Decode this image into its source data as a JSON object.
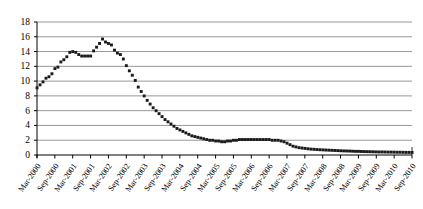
{
  "chart_data": {
    "type": "scatter",
    "title": "",
    "subtitle": "",
    "xlabel": "",
    "ylabel": "",
    "ylim": [
      0,
      18
    ],
    "ytick_step": 2,
    "yticks": [
      "0",
      "2",
      "4",
      "6",
      "8",
      "10",
      "12",
      "14",
      "16",
      "18"
    ],
    "grid": true,
    "grid_axis": "y",
    "legend": "none",
    "marker": "filled-square-dot",
    "marker_color": "#1a1a1a",
    "axis_color": "#000000",
    "grid_color": "#8c8c8c",
    "background": "#ffffff",
    "xtick_labels": [
      "Mar-2000",
      "Sep-2000",
      "Mar-2001",
      "Sep-2001",
      "Mar-2002",
      "Sep-2002",
      "Mar-2003",
      "Sep-2003",
      "Mar-2004",
      "Sep-2004",
      "Mar-2005",
      "Sep-2005",
      "Mar-2006",
      "Sep-2006",
      "Mar-2007",
      "Sep-2007",
      "Mar-2008",
      "Sep-2008",
      "Mar-2009",
      "Sep-2009",
      "Mar-2010",
      "Sep-2010"
    ],
    "xtick_interval_months": 6,
    "x_start": "Mar-2000",
    "x_end": "Sep-2010",
    "x_points": [
      "Mar-2000",
      "Apr-2000",
      "May-2000",
      "Jun-2000",
      "Jul-2000",
      "Aug-2000",
      "Sep-2000",
      "Oct-2000",
      "Nov-2000",
      "Dec-2000",
      "Jan-2001",
      "Feb-2001",
      "Mar-2001",
      "Apr-2001",
      "May-2001",
      "Jun-2001",
      "Jul-2001",
      "Aug-2001",
      "Sep-2001",
      "Oct-2001",
      "Nov-2001",
      "Dec-2001",
      "Jan-2002",
      "Feb-2002",
      "Mar-2002",
      "Apr-2002",
      "May-2002",
      "Jun-2002",
      "Jul-2002",
      "Aug-2002",
      "Sep-2002",
      "Oct-2002",
      "Nov-2002",
      "Dec-2002",
      "Jan-2003",
      "Feb-2003",
      "Mar-2003",
      "Apr-2003",
      "May-2003",
      "Jun-2003",
      "Jul-2003",
      "Aug-2003",
      "Sep-2003",
      "Oct-2003",
      "Nov-2003",
      "Dec-2003",
      "Jan-2004",
      "Feb-2004",
      "Mar-2004",
      "Apr-2004",
      "May-2004",
      "Jun-2004",
      "Jul-2004",
      "Aug-2004",
      "Sep-2004",
      "Oct-2004",
      "Nov-2004",
      "Dec-2004",
      "Jan-2005",
      "Feb-2005",
      "Mar-2005",
      "Apr-2005",
      "May-2005",
      "Jun-2005",
      "Jul-2005",
      "Aug-2005",
      "Sep-2005",
      "Oct-2005",
      "Nov-2005",
      "Dec-2005",
      "Jan-2006",
      "Feb-2006",
      "Mar-2006",
      "Apr-2006",
      "May-2006",
      "Jun-2006",
      "Jul-2006",
      "Aug-2006",
      "Sep-2006",
      "Oct-2006",
      "Nov-2006",
      "Dec-2006",
      "Jan-2007",
      "Feb-2007",
      "Mar-2007",
      "Apr-2007",
      "May-2007",
      "Jun-2007",
      "Jul-2007",
      "Aug-2007",
      "Sep-2007",
      "Oct-2007",
      "Nov-2007",
      "Dec-2007",
      "Jan-2008",
      "Feb-2008",
      "Mar-2008",
      "Apr-2008",
      "May-2008",
      "Jun-2008",
      "Jul-2008",
      "Aug-2008",
      "Sep-2008",
      "Oct-2008",
      "Nov-2008",
      "Dec-2008",
      "Jan-2009",
      "Feb-2009",
      "Mar-2009",
      "Apr-2009",
      "May-2009",
      "Jun-2009",
      "Jul-2009",
      "Aug-2009",
      "Sep-2009",
      "Oct-2009",
      "Nov-2009",
      "Dec-2009",
      "Jan-2010",
      "Feb-2010",
      "Mar-2010",
      "Apr-2010",
      "May-2010",
      "Jun-2010",
      "Jul-2010",
      "Aug-2010",
      "Sep-2010"
    ],
    "values": [
      9.1,
      9.5,
      9.9,
      10.4,
      10.6,
      11.0,
      11.7,
      11.9,
      12.6,
      12.9,
      13.3,
      13.9,
      14.0,
      13.9,
      13.6,
      13.4,
      13.4,
      13.4,
      13.4,
      14.1,
      14.6,
      15.1,
      15.7,
      15.3,
      15.1,
      14.9,
      14.2,
      13.8,
      13.6,
      13.0,
      12.1,
      11.4,
      10.8,
      10.1,
      9.2,
      8.6,
      8.0,
      7.4,
      6.9,
      6.4,
      6.0,
      5.6,
      5.2,
      4.8,
      4.5,
      4.2,
      3.9,
      3.6,
      3.4,
      3.2,
      3.0,
      2.8,
      2.6,
      2.5,
      2.4,
      2.3,
      2.2,
      2.1,
      2.0,
      2.0,
      1.9,
      1.9,
      1.8,
      1.8,
      1.9,
      1.9,
      2.0,
      2.0,
      2.1,
      2.1,
      2.1,
      2.1,
      2.1,
      2.1,
      2.1,
      2.1,
      2.1,
      2.1,
      2.1,
      2.0,
      2.0,
      2.0,
      1.9,
      1.8,
      1.6,
      1.4,
      1.2,
      1.1,
      1.0,
      0.95,
      0.9,
      0.85,
      0.8,
      0.78,
      0.75,
      0.72,
      0.7,
      0.68,
      0.66,
      0.64,
      0.62,
      0.6,
      0.58,
      0.56,
      0.55,
      0.54,
      0.52,
      0.5,
      0.5,
      0.48,
      0.47,
      0.46,
      0.45,
      0.44,
      0.43,
      0.42,
      0.42,
      0.41,
      0.4,
      0.4,
      0.39,
      0.38,
      0.38,
      0.37,
      0.36,
      0.36,
      0.35
    ]
  }
}
